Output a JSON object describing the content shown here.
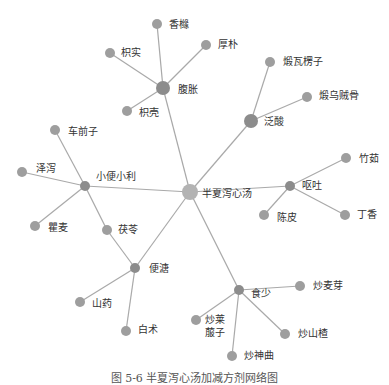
{
  "diagram": {
    "type": "network",
    "edge_color": "#a9a9a9",
    "nodes": [
      {
        "id": "center",
        "label": "半夏泻心汤",
        "x": 190,
        "y": 192,
        "r": 8,
        "color": "#b3b3b3",
        "lx": 202,
        "ly": 188
      },
      {
        "id": "fuzhang",
        "label": "腹胀",
        "x": 163,
        "y": 88,
        "r": 7,
        "color": "#8c8c8c",
        "lx": 178,
        "ly": 84
      },
      {
        "id": "xiangyuan",
        "label": "香橼",
        "x": 157,
        "y": 24,
        "r": 5,
        "color": "#9e9e9e",
        "lx": 169,
        "ly": 19
      },
      {
        "id": "houpo",
        "label": "厚朴",
        "x": 206,
        "y": 45,
        "r": 5,
        "color": "#9e9e9e",
        "lx": 218,
        "ly": 39
      },
      {
        "id": "zhishi",
        "label": "枳实",
        "x": 110,
        "y": 53,
        "r": 5,
        "color": "#9e9e9e",
        "lx": 121,
        "ly": 47
      },
      {
        "id": "zhiqiao",
        "label": "枳壳",
        "x": 127,
        "y": 111,
        "r": 5,
        "color": "#9e9e9e",
        "lx": 139,
        "ly": 107
      },
      {
        "id": "fansuan",
        "label": "泛酸",
        "x": 251,
        "y": 121,
        "r": 7,
        "color": "#8c8c8c",
        "lx": 264,
        "ly": 116
      },
      {
        "id": "duanwalengzi",
        "label": "煅瓦楞子",
        "x": 270,
        "y": 62,
        "r": 5,
        "color": "#9e9e9e",
        "lx": 283,
        "ly": 56
      },
      {
        "id": "duanwuzeigu",
        "label": "煅乌贼骨",
        "x": 307,
        "y": 97,
        "r": 5,
        "color": "#9e9e9e",
        "lx": 319,
        "ly": 90
      },
      {
        "id": "outu",
        "label": "呕吐",
        "x": 290,
        "y": 186,
        "r": 5,
        "color": "#8c8c8c",
        "lx": 302,
        "ly": 180
      },
      {
        "id": "zhuru",
        "label": "竹茹",
        "x": 346,
        "y": 158,
        "r": 5,
        "color": "#9e9e9e",
        "lx": 359,
        "ly": 153
      },
      {
        "id": "chenpi",
        "label": "陈皮",
        "x": 264,
        "y": 215,
        "r": 5,
        "color": "#9e9e9e",
        "lx": 277,
        "ly": 212
      },
      {
        "id": "dingxiang",
        "label": "丁香",
        "x": 345,
        "y": 215,
        "r": 5,
        "color": "#9e9e9e",
        "lx": 357,
        "ly": 209
      },
      {
        "id": "xiaobian",
        "label": "小便小利",
        "x": 85,
        "y": 186,
        "r": 5,
        "color": "#8c8c8c",
        "lx": 96,
        "ly": 171
      },
      {
        "id": "cheqianzi",
        "label": "车前子",
        "x": 55,
        "y": 130,
        "r": 5,
        "color": "#9e9e9e",
        "lx": 68,
        "ly": 126
      },
      {
        "id": "zexie",
        "label": "泽泻",
        "x": 22,
        "y": 172,
        "r": 5,
        "color": "#9e9e9e",
        "lx": 36,
        "ly": 163
      },
      {
        "id": "qumai",
        "label": "瞿麦",
        "x": 35,
        "y": 226,
        "r": 5,
        "color": "#9e9e9e",
        "lx": 48,
        "ly": 222
      },
      {
        "id": "fuling",
        "label": "茯苓",
        "x": 107,
        "y": 230,
        "r": 5,
        "color": "#9e9e9e",
        "lx": 118,
        "ly": 224
      },
      {
        "id": "biantang",
        "label": "便溏",
        "x": 135,
        "y": 268,
        "r": 5,
        "color": "#8c8c8c",
        "lx": 149,
        "ly": 263
      },
      {
        "id": "shanyao",
        "label": "山药",
        "x": 80,
        "y": 302,
        "r": 5,
        "color": "#9e9e9e",
        "lx": 92,
        "ly": 298
      },
      {
        "id": "baizhu",
        "label": "白术",
        "x": 126,
        "y": 331,
        "r": 5,
        "color": "#9e9e9e",
        "lx": 138,
        "ly": 324
      },
      {
        "id": "shishao",
        "label": "食少",
        "x": 239,
        "y": 290,
        "r": 5,
        "color": "#8c8c8c",
        "lx": 251,
        "ly": 288
      },
      {
        "id": "chaomaiya",
        "label": "炒麦芽",
        "x": 300,
        "y": 286,
        "r": 5,
        "color": "#9e9e9e",
        "lx": 313,
        "ly": 280
      },
      {
        "id": "chaolaifuzi",
        "label": "炒莱\n菔子",
        "x": 196,
        "y": 320,
        "r": 5,
        "color": "#9e9e9e",
        "lx": 205,
        "ly": 313
      },
      {
        "id": "chaoshanzha",
        "label": "炒山楂",
        "x": 285,
        "y": 334,
        "r": 5,
        "color": "#9e9e9e",
        "lx": 298,
        "ly": 328
      },
      {
        "id": "chaoshenqu",
        "label": "炒神曲",
        "x": 232,
        "y": 356,
        "r": 5,
        "color": "#9e9e9e",
        "lx": 244,
        "ly": 350
      }
    ],
    "edges": [
      [
        "center",
        "fuzhang"
      ],
      [
        "center",
        "fansuan"
      ],
      [
        "center",
        "outu"
      ],
      [
        "center",
        "xiaobian"
      ],
      [
        "center",
        "biantang"
      ],
      [
        "center",
        "shishao"
      ],
      [
        "fuzhang",
        "xiangyuan"
      ],
      [
        "fuzhang",
        "houpo"
      ],
      [
        "fuzhang",
        "zhishi"
      ],
      [
        "fuzhang",
        "zhiqiao"
      ],
      [
        "fansuan",
        "duanwalengzi"
      ],
      [
        "fansuan",
        "duanwuzeigu"
      ],
      [
        "outu",
        "zhuru"
      ],
      [
        "outu",
        "chenpi"
      ],
      [
        "outu",
        "dingxiang"
      ],
      [
        "xiaobian",
        "cheqianzi"
      ],
      [
        "xiaobian",
        "zexie"
      ],
      [
        "xiaobian",
        "qumai"
      ],
      [
        "xiaobian",
        "fuling"
      ],
      [
        "fuling",
        "biantang"
      ],
      [
        "biantang",
        "shanyao"
      ],
      [
        "biantang",
        "baizhu"
      ],
      [
        "shishao",
        "chaomaiya"
      ],
      [
        "shishao",
        "chaolaifuzi"
      ],
      [
        "shishao",
        "chaoshanzha"
      ],
      [
        "shishao",
        "chaoshenqu"
      ]
    ]
  },
  "caption": {
    "text": "图 5-6  半夏泻心汤加减方剂网络图"
  }
}
